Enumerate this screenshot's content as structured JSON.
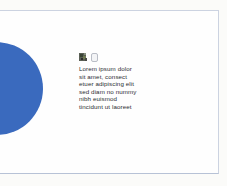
{
  "page": {
    "background_color": "#fbfbf9",
    "frame_fill_color": "#fefefe",
    "frame_border_color": "#ccd3e1"
  },
  "graphic": {
    "shape": "circle",
    "color": "#3a6abe"
  },
  "icons": [
    {
      "name": "clipart-icon"
    },
    {
      "name": "document-icon"
    }
  ],
  "text_block": {
    "lines": [
      "Lorem ipsum dolor",
      "sit amet, consect",
      "etuer adipiscing elit",
      "sed diam no nummy",
      "nibh euismod",
      "tincidunt ut laoreet"
    ]
  }
}
